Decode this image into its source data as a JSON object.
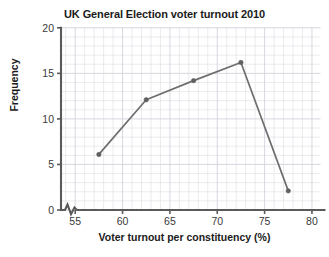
{
  "chart_data": {
    "type": "line",
    "title": "UK General Election voter turnout 2010",
    "xlabel": "Voter turnout per constituency (%)",
    "ylabel": "Frequency",
    "x": [
      57.5,
      62.5,
      67.5,
      72.5,
      77.5
    ],
    "values": [
      6.1,
      12.1,
      14.2,
      16.2,
      2.1
    ],
    "xlim": [
      53.5,
      80.9
    ],
    "ylim": [
      0,
      20
    ],
    "xticks": [
      "55",
      "60",
      "65",
      "70",
      "75",
      "80"
    ],
    "xtick_values": [
      55,
      60,
      65,
      70,
      75,
      80
    ],
    "yticks": [
      "0",
      "5",
      "10",
      "15",
      "20"
    ],
    "ytick_values": [
      0,
      5,
      10,
      15,
      20
    ],
    "grid": true,
    "grid_minor_step_x": 1,
    "grid_minor_step_y": 1,
    "legend": null,
    "axis_break_x": true,
    "marker": "circle",
    "line_color": "#6e6e6e",
    "marker_color": "#5f5f5f",
    "grid_color": "#e2e2e8",
    "grid_major_color": "#d3d3dc",
    "axis_color": "#5a5a5a",
    "background": "#ffffff"
  }
}
